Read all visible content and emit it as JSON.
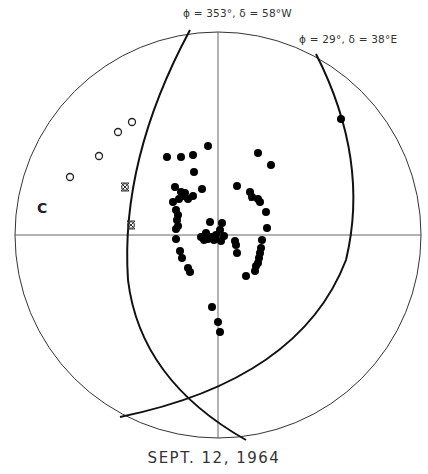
{
  "chart_data": {
    "type": "scatter",
    "subtype": "stereonet",
    "title": "SEPT. 12, 1964",
    "xlabel": "",
    "ylabel": "",
    "grid": false,
    "center": [
      218,
      235
    ],
    "radius": 203,
    "great_circles": [
      {
        "label": "ϕ = 353°,  δ = 58°W",
        "path": "M190,30 Q120,160 128,280 Q140,380 246,440"
      },
      {
        "label": "ϕ = 29°,  δ = 38°E",
        "path": "M316,54 Q370,160 346,260 Q300,380 120,417"
      }
    ],
    "annotations": [
      {
        "text": "ϕ = 353°,  δ = 58°W",
        "x": 183,
        "y": 7
      },
      {
        "text": "ϕ = 29°,  δ = 38°E",
        "x": 299,
        "y": 33
      },
      {
        "text": "C",
        "x": 37,
        "y": 200
      }
    ],
    "series": [
      {
        "name": "filled",
        "marker": "filled-circle",
        "points": [
          [
            341,
            119
          ],
          [
            208,
            146
          ],
          [
            167,
            157
          ],
          [
            181,
            157
          ],
          [
            193,
            155
          ],
          [
            194,
            172
          ],
          [
            258,
            153
          ],
          [
            271,
            165
          ],
          [
            175,
            187
          ],
          [
            181,
            192
          ],
          [
            184,
            196
          ],
          [
            188,
            199
          ],
          [
            185,
            193
          ],
          [
            193,
            196
          ],
          [
            179,
            199
          ],
          [
            173,
            202
          ],
          [
            202,
            189
          ],
          [
            176,
            210
          ],
          [
            178,
            215
          ],
          [
            177,
            220
          ],
          [
            178,
            226
          ],
          [
            176,
            229
          ],
          [
            176,
            239
          ],
          [
            237,
            186
          ],
          [
            250,
            192
          ],
          [
            252,
            197
          ],
          [
            258,
            199
          ],
          [
            260,
            202
          ],
          [
            266,
            212
          ],
          [
            267,
            228
          ],
          [
            210,
            222
          ],
          [
            222,
            223
          ],
          [
            220,
            230
          ],
          [
            224,
            236
          ],
          [
            216,
            235
          ],
          [
            206,
            233
          ],
          [
            201,
            237
          ],
          [
            208,
            239
          ],
          [
            214,
            240
          ],
          [
            221,
            241
          ],
          [
            204,
            240
          ],
          [
            211,
            237
          ],
          [
            235,
            241
          ],
          [
            236,
            245
          ],
          [
            237,
            253
          ],
          [
            262,
            240
          ],
          [
            261,
            248
          ],
          [
            260,
            253
          ],
          [
            259,
            258
          ],
          [
            258,
            263
          ],
          [
            256,
            266
          ],
          [
            255,
            271
          ],
          [
            246,
            276
          ],
          [
            180,
            251
          ],
          [
            182,
            258
          ],
          [
            188,
            268
          ],
          [
            190,
            272
          ],
          [
            212,
            307
          ],
          [
            218,
            322
          ],
          [
            220,
            332
          ]
        ]
      },
      {
        "name": "open",
        "marker": "open-circle",
        "points": [
          [
            132,
            122
          ],
          [
            118,
            132
          ],
          [
            99,
            156
          ],
          [
            70,
            177
          ]
        ]
      },
      {
        "name": "crossed",
        "marker": "crossed-circle",
        "points": [
          [
            125,
            187
          ],
          [
            131,
            225
          ]
        ]
      },
      {
        "name": "arrow-marker",
        "marker": "arrow",
        "points": [
          [
            250,
            194
          ]
        ]
      }
    ]
  },
  "labels": {
    "top_circle": "ϕ = 353°,  δ = 58°W",
    "right_circle": "ϕ = 29°,  δ = 38°E",
    "c_marker": "C",
    "caption": "SEPT. 12, 1964"
  }
}
